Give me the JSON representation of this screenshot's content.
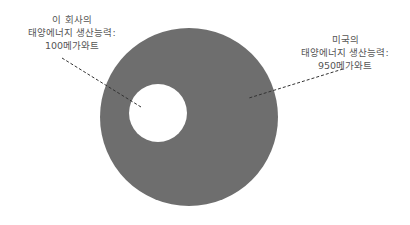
{
  "diagram": {
    "type": "nested-circle-comparison",
    "colors": {
      "outer_circle": "#6e6e6e",
      "inner_circle": "#ffffff",
      "leader_line": "#333333",
      "text": "#555555"
    },
    "company": {
      "line1": "이 회사의",
      "line2": "태양에너지 생산능력:",
      "line3": "100메가와트",
      "value_mw": 100
    },
    "usa": {
      "line1": "미국의",
      "line2": "태양에너지 생산능력:",
      "line3": "950메가와트",
      "value_mw": 950
    }
  }
}
